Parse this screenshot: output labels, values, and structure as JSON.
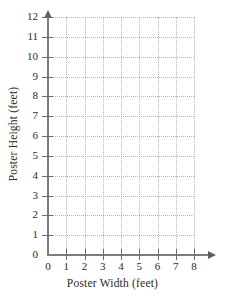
{
  "chart_data": {
    "type": "scatter",
    "title": "",
    "xlabel": "Poster Width (feet)",
    "ylabel": "Poster Height (feet)",
    "xlim": [
      0,
      8
    ],
    "ylim": [
      0,
      12
    ],
    "xticks": [
      0,
      1,
      2,
      3,
      4,
      5,
      6,
      7,
      8
    ],
    "yticks": [
      0,
      1,
      2,
      3,
      4,
      5,
      6,
      7,
      8,
      9,
      10,
      11,
      12
    ],
    "xtick_labels": [
      "0",
      "1",
      "2",
      "3",
      "4",
      "5",
      "6",
      "7",
      "8"
    ],
    "ytick_labels": [
      "0",
      "1",
      "2",
      "3",
      "4",
      "5",
      "6",
      "7",
      "8",
      "9",
      "10",
      "11",
      "12"
    ],
    "grid": true,
    "grid_style": "dotted",
    "legend": false,
    "series": [
      {
        "name": "",
        "x": [],
        "y": []
      }
    ],
    "annotations": [],
    "axis_arrows": {
      "x": "right",
      "y": "up"
    },
    "colors": {
      "axis": "#7c7c7c",
      "grid": "#b9b9b9",
      "text": "#2b2b2b",
      "background": "#ffffff"
    }
  },
  "axes": {
    "x_title": "Poster Width (feet)",
    "y_title": "Poster Height (feet)"
  }
}
